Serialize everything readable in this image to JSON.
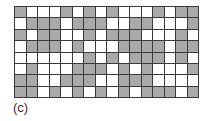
{
  "figure": {
    "label": "(c)",
    "rows": 8,
    "columns": 16,
    "colors": {
      "filled": "#a9a9a9",
      "empty": "#ffffff",
      "border": "#3a3a3a"
    },
    "grid": [
      [
        1,
        0,
        0,
        0,
        1,
        0,
        1,
        0,
        1,
        0,
        0,
        0,
        1,
        0,
        1,
        1
      ],
      [
        0,
        1,
        1,
        1,
        0,
        1,
        1,
        1,
        0,
        0,
        1,
        1,
        0,
        0,
        0,
        1
      ],
      [
        1,
        0,
        1,
        1,
        0,
        0,
        1,
        0,
        1,
        1,
        1,
        0,
        0,
        0,
        1,
        0
      ],
      [
        0,
        1,
        1,
        1,
        0,
        1,
        0,
        0,
        0,
        1,
        1,
        1,
        1,
        0,
        1,
        1
      ],
      [
        0,
        0,
        0,
        0,
        0,
        0,
        1,
        0,
        1,
        0,
        1,
        1,
        1,
        0,
        1,
        0
      ],
      [
        0,
        1,
        0,
        0,
        0,
        1,
        1,
        1,
        0,
        1,
        0,
        1,
        0,
        0,
        0,
        1
      ],
      [
        1,
        1,
        0,
        0,
        1,
        1,
        1,
        0,
        0,
        1,
        1,
        1,
        0,
        0,
        0,
        0
      ],
      [
        1,
        1,
        0,
        1,
        0,
        1,
        0,
        1,
        0,
        1,
        0,
        1,
        1,
        1,
        0,
        1
      ]
    ]
  }
}
